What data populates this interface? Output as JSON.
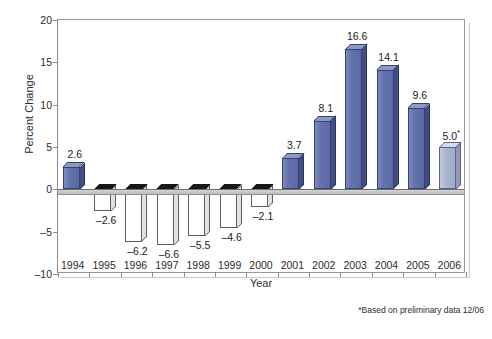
{
  "chart_data": {
    "type": "bar",
    "title": "",
    "xlabel": "Year",
    "ylabel": "Percent Change",
    "categories": [
      "1994",
      "1995",
      "1996",
      "1997",
      "1998",
      "1999",
      "2000",
      "2001",
      "2002",
      "2003",
      "2004",
      "2005",
      "2006"
    ],
    "values": [
      2.6,
      -2.6,
      -6.2,
      -6.6,
      -5.5,
      -4.6,
      -2.1,
      3.7,
      8.1,
      16.6,
      14.1,
      9.6,
      5.0
    ],
    "value_labels": [
      "2.6",
      "-2.6",
      "-6.2",
      "-6.6",
      "-5.5",
      "-4.6",
      "-2.1",
      "3.7",
      "8.1",
      "16.6",
      "14.1",
      "9.6",
      "5.0*"
    ],
    "ylim": [
      -10,
      20
    ],
    "yticks": [
      20,
      15,
      10,
      5,
      0,
      -5,
      -10
    ],
    "ytick_labels": [
      "20",
      "15",
      "10",
      "5",
      "0",
      "-5",
      "-10"
    ],
    "grid": false,
    "legend": "none",
    "annotations": [
      "*Based on preliminary data 12/06"
    ],
    "series_styles": {
      "positive_fill": "#6473ad",
      "positive_edge": "#35406e",
      "negative_fill": "#ffffff",
      "negative_edge": "#5d5d5d",
      "negative_cap": "#17171a",
      "preliminary_fill": "#aab5d0",
      "preliminary_edge": "#5a6386"
    }
  },
  "axes": {
    "y_title": "Percent Change",
    "x_title": "Year"
  },
  "footnote": {
    "text": "*Based on preliminary data 12/06"
  },
  "caption": {
    "text": ""
  }
}
